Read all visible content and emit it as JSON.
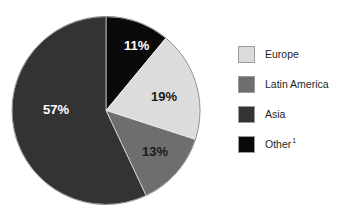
{
  "chart_data": {
    "type": "pie",
    "title": "",
    "subtitle": "",
    "xlabel": "",
    "ylabel": "",
    "grid": false,
    "legend_position": "right",
    "start_angle_deg": 0,
    "direction": "clockwise",
    "categories": [
      "Other",
      "Europe",
      "Latin America",
      "Asia"
    ],
    "values": [
      11,
      19,
      13,
      57
    ],
    "value_suffix": "%",
    "slices": [
      {
        "label": "Other",
        "legend_label": "Other",
        "footnote_marker": "1",
        "value": 11,
        "data_label": "11%",
        "color": "#0a0a0a",
        "label_color": "#ffffff",
        "label_x": 124,
        "label_y": 39
      },
      {
        "label": "Europe",
        "legend_label": "Europe",
        "footnote_marker": "",
        "value": 19,
        "data_label": "19%",
        "color": "#dcdcdc",
        "label_color": "#1a1a1a",
        "label_x": 151,
        "label_y": 90
      },
      {
        "label": "Latin America",
        "legend_label": "Latin America",
        "footnote_marker": "",
        "value": 13,
        "data_label": "13%",
        "color": "#6e6e6e",
        "label_color": "#1a1a1a",
        "label_x": 142,
        "label_y": 145
      },
      {
        "label": "Asia",
        "legend_label": "Asia",
        "footnote_marker": "",
        "value": 57,
        "data_label": "57%",
        "color": "#333333",
        "label_color": "#ffffff",
        "label_x": 43,
        "label_y": 103
      }
    ]
  },
  "legend": {
    "items": [
      {
        "label": "Europe",
        "footnote": "",
        "color": "#dcdcdc"
      },
      {
        "label": "Latin America",
        "footnote": "",
        "color": "#6e6e6e"
      },
      {
        "label": "Asia",
        "footnote": "",
        "color": "#333333"
      },
      {
        "label": "Other",
        "footnote": "1",
        "color": "#0a0a0a"
      }
    ]
  }
}
